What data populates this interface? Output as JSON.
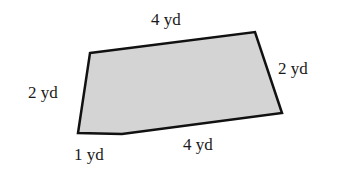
{
  "diagram": {
    "shape": "pentagon",
    "fill_color": "#d4d4d4",
    "stroke_color": "#111111",
    "vertices": [
      [
        90,
        53
      ],
      [
        255,
        32
      ],
      [
        282,
        113
      ],
      [
        122,
        134
      ],
      [
        78,
        133
      ]
    ],
    "labels": {
      "top": "4 yd",
      "right": "2 yd",
      "bottom": "4 yd",
      "bottom_left": "1 yd",
      "left": "2 yd"
    }
  }
}
